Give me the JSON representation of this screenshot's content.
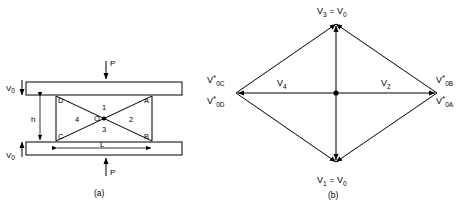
{
  "figure": {
    "panel_a": {
      "caption": "(a)",
      "loads": [
        {
          "name": "load-top",
          "label": "P"
        },
        {
          "name": "load-bottom",
          "label": "P"
        }
      ],
      "velocities": [
        {
          "name": "velocity-top",
          "base": "V",
          "sub": "0"
        },
        {
          "name": "velocity-bottom",
          "base": "V",
          "sub": "0"
        }
      ],
      "dimensions": [
        {
          "name": "height-dimension",
          "label": "h"
        },
        {
          "name": "length-dimension",
          "label": "L"
        }
      ],
      "points": [
        {
          "name": "point-d",
          "label": "D"
        },
        {
          "name": "point-a",
          "label": "A"
        },
        {
          "name": "point-c",
          "label": "C"
        },
        {
          "name": "point-b",
          "label": "B"
        },
        {
          "name": "point-o",
          "label": "O"
        }
      ],
      "regions": [
        {
          "name": "region-1",
          "label": "1"
        },
        {
          "name": "region-2",
          "label": "2"
        },
        {
          "name": "region-3",
          "label": "3"
        },
        {
          "name": "region-4",
          "label": "4"
        }
      ]
    },
    "panel_b": {
      "caption": "(b)",
      "vertices": [
        {
          "name": "vertex-top",
          "base": "V",
          "sub": "3",
          "equals": "=",
          "rhs_base": "V",
          "rhs_sub": "0"
        },
        {
          "name": "vertex-bottom",
          "base": "V",
          "sub": "1",
          "equals": "=",
          "rhs_base": "V",
          "rhs_sub": "0"
        }
      ],
      "corner_labels": [
        {
          "name": "label-v0c",
          "base": "V",
          "sup": "*",
          "sub": "0C"
        },
        {
          "name": "label-v0d",
          "base": "V",
          "sup": "*",
          "sub": "0D"
        },
        {
          "name": "label-v0b",
          "base": "V",
          "sup": "*",
          "sub": "0B"
        },
        {
          "name": "label-v0a",
          "base": "V",
          "sup": "*",
          "sub": "0A"
        }
      ],
      "interior_labels": [
        {
          "name": "label-v4",
          "base": "V",
          "sub": "4"
        },
        {
          "name": "label-v2",
          "base": "V",
          "sub": "2"
        }
      ]
    }
  },
  "colors": {
    "ink": "#000000",
    "paper": "#ffffff"
  }
}
